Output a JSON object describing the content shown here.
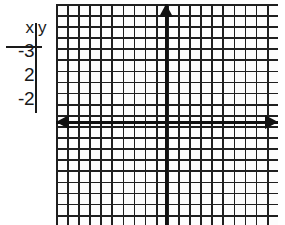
{
  "table": {
    "name": "xy-value-table",
    "headers": {
      "x": "x",
      "y": "y"
    },
    "rows": [
      {
        "x": "-3",
        "y": ""
      },
      {
        "x": "2",
        "y": ""
      },
      {
        "x": "-2",
        "y": ""
      }
    ]
  },
  "graph": {
    "name": "cartesian-coordinate-grid",
    "grid": {
      "visible": true,
      "cell_size_px": 11,
      "columns": 20,
      "rows": 20,
      "line_color": "#1f1f1f",
      "background_color": "#fdfdfd"
    },
    "axes": {
      "x_axis": {
        "label": "",
        "color": "#111111",
        "arrow_start": "left-arrow-icon",
        "arrow_end": "right-arrow-icon"
      },
      "y_axis": {
        "label": "",
        "color": "#111111",
        "arrow_end": "up-arrow-icon"
      },
      "tick_labels": [],
      "origin_label": ""
    },
    "plotted_points": [],
    "plotted_curves": []
  },
  "chart_data": {
    "type": "scatter",
    "title": "",
    "xlabel": "x",
    "ylabel": "y",
    "xlim": [
      -10,
      10
    ],
    "ylim": [
      -9,
      11
    ],
    "grid": true,
    "legend": "none",
    "x": [],
    "y": [],
    "table_values": {
      "columns": [
        "x",
        "y"
      ],
      "rows": [
        [
          "-3",
          ""
        ],
        [
          "2",
          ""
        ],
        [
          "-2",
          ""
        ]
      ]
    }
  }
}
